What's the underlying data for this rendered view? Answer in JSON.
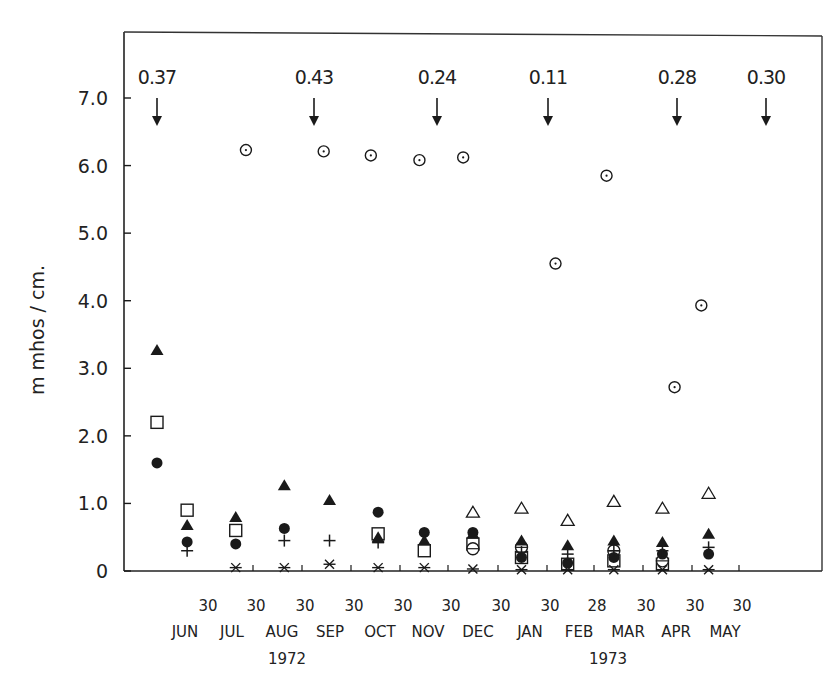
{
  "chart_data": {
    "type": "scatter",
    "title": "",
    "xlabel": "",
    "ylabel": "m mhos / cm.",
    "ylim": [
      0,
      7.8
    ],
    "grid": false,
    "y_ticks": [
      "0",
      "1.0",
      "2.0",
      "3.0",
      "4.0",
      "5.0",
      "6.0",
      "7.0"
    ],
    "x_tick_days": [
      "30",
      "30",
      "30",
      "30",
      "30",
      "30",
      "30",
      "30",
      "28",
      "30",
      "30",
      "30"
    ],
    "x_months": [
      "JUN",
      "JUL",
      "AUG",
      "SEP",
      "OCT",
      "NOV",
      "DEC",
      "JAN",
      "FEB",
      "MAR",
      "APR",
      "MAY"
    ],
    "x_years": [
      {
        "label": "1972",
        "under": "AUG"
      },
      {
        "label": "1973",
        "under": "MAR"
      }
    ],
    "arrows": [
      {
        "label": "0.37",
        "month": "JUN"
      },
      {
        "label": "0.43",
        "month": "SEP"
      },
      {
        "label": "0.24",
        "month": "NOV"
      },
      {
        "label": "0.11",
        "month": "JAN"
      },
      {
        "label": "0.28",
        "month": "APR"
      },
      {
        "label": "0.30",
        "month": "MAY-end"
      }
    ],
    "sample_points": [
      "Jun-start",
      "Jun-end",
      "Jul",
      "Aug",
      "Sep",
      "Oct",
      "Nov",
      "Dec",
      "Jan",
      "Feb",
      "Mar",
      "Apr",
      "May"
    ],
    "series": [
      {
        "name": "dotted-circle",
        "marker": "circle-dot",
        "points": [
          {
            "x": 1.83,
            "y": 6.23
          },
          {
            "x": 3.43,
            "y": 6.21
          },
          {
            "x": 4.4,
            "y": 6.15
          },
          {
            "x": 5.4,
            "y": 6.08
          },
          {
            "x": 6.3,
            "y": 6.12
          },
          {
            "x": 8.2,
            "y": 4.55
          },
          {
            "x": 9.25,
            "y": 5.85
          },
          {
            "x": 10.65,
            "y": 2.72
          },
          {
            "x": 11.2,
            "y": 3.93
          }
        ]
      },
      {
        "name": "filled-triangle",
        "marker": "triangle-filled",
        "points": [
          {
            "x": 0.0,
            "y": 3.27
          },
          {
            "x": 0.62,
            "y": 0.68
          },
          {
            "x": 1.62,
            "y": 0.8
          },
          {
            "x": 2.62,
            "y": 1.27
          },
          {
            "x": 3.55,
            "y": 1.05
          },
          {
            "x": 4.55,
            "y": 0.5
          },
          {
            "x": 5.5,
            "y": 0.45
          },
          {
            "x": 6.5,
            "y": 0.55
          },
          {
            "x": 7.5,
            "y": 0.45
          },
          {
            "x": 8.45,
            "y": 0.38
          },
          {
            "x": 9.4,
            "y": 0.45
          },
          {
            "x": 10.4,
            "y": 0.43
          },
          {
            "x": 11.35,
            "y": 0.55
          }
        ]
      },
      {
        "name": "open-square",
        "marker": "square-open",
        "points": [
          {
            "x": 0.0,
            "y": 2.2
          },
          {
            "x": 0.62,
            "y": 0.9
          },
          {
            "x": 1.62,
            "y": 0.6
          },
          {
            "x": 4.55,
            "y": 0.55
          },
          {
            "x": 5.5,
            "y": 0.3
          },
          {
            "x": 6.5,
            "y": 0.4
          },
          {
            "x": 7.5,
            "y": 0.2
          },
          {
            "x": 8.45,
            "y": 0.1
          },
          {
            "x": 9.4,
            "y": 0.15
          },
          {
            "x": 10.4,
            "y": 0.1
          }
        ]
      },
      {
        "name": "filled-circle",
        "marker": "circle-filled",
        "points": [
          {
            "x": 0.0,
            "y": 1.6
          },
          {
            "x": 0.62,
            "y": 0.43
          },
          {
            "x": 1.62,
            "y": 0.4
          },
          {
            "x": 2.62,
            "y": 0.63
          },
          {
            "x": 4.55,
            "y": 0.87
          },
          {
            "x": 5.5,
            "y": 0.57
          },
          {
            "x": 6.5,
            "y": 0.57
          },
          {
            "x": 7.5,
            "y": 0.2
          },
          {
            "x": 8.45,
            "y": 0.12
          },
          {
            "x": 9.4,
            "y": 0.2
          },
          {
            "x": 10.4,
            "y": 0.25
          },
          {
            "x": 11.35,
            "y": 0.25
          }
        ]
      },
      {
        "name": "plus",
        "marker": "plus",
        "points": [
          {
            "x": 0.62,
            "y": 0.3
          },
          {
            "x": 2.62,
            "y": 0.45
          },
          {
            "x": 3.55,
            "y": 0.45
          },
          {
            "x": 4.55,
            "y": 0.42
          },
          {
            "x": 7.5,
            "y": 0.28
          },
          {
            "x": 8.45,
            "y": 0.25
          },
          {
            "x": 9.4,
            "y": 0.3
          },
          {
            "x": 10.4,
            "y": 0.3
          },
          {
            "x": 11.35,
            "y": 0.35
          }
        ]
      },
      {
        "name": "open-triangle",
        "marker": "triangle-open",
        "points": [
          {
            "x": 6.5,
            "y": 0.87
          },
          {
            "x": 7.5,
            "y": 0.93
          },
          {
            "x": 8.45,
            "y": 0.75
          },
          {
            "x": 9.4,
            "y": 1.03
          },
          {
            "x": 10.4,
            "y": 0.93
          },
          {
            "x": 11.35,
            "y": 1.15
          }
        ]
      },
      {
        "name": "open-circle",
        "marker": "circle-open",
        "points": [
          {
            "x": 6.5,
            "y": 0.33
          },
          {
            "x": 7.5,
            "y": 0.35
          },
          {
            "x": 9.4,
            "y": 0.3
          },
          {
            "x": 10.4,
            "y": 0.15
          }
        ]
      },
      {
        "name": "asterisk",
        "marker": "asterisk",
        "points": [
          {
            "x": 1.62,
            "y": 0.05
          },
          {
            "x": 2.62,
            "y": 0.05
          },
          {
            "x": 3.55,
            "y": 0.1
          },
          {
            "x": 4.55,
            "y": 0.05
          },
          {
            "x": 5.5,
            "y": 0.05
          },
          {
            "x": 6.5,
            "y": 0.03
          },
          {
            "x": 7.5,
            "y": 0.02
          },
          {
            "x": 8.45,
            "y": 0.02
          },
          {
            "x": 9.4,
            "y": 0.02
          },
          {
            "x": 10.4,
            "y": 0.02
          },
          {
            "x": 11.35,
            "y": 0.02
          }
        ]
      }
    ]
  },
  "axis": {
    "ylabel": "m mhos / cm."
  },
  "colors": {
    "ink": "#1a1a1a",
    "background": "#ffffff"
  }
}
